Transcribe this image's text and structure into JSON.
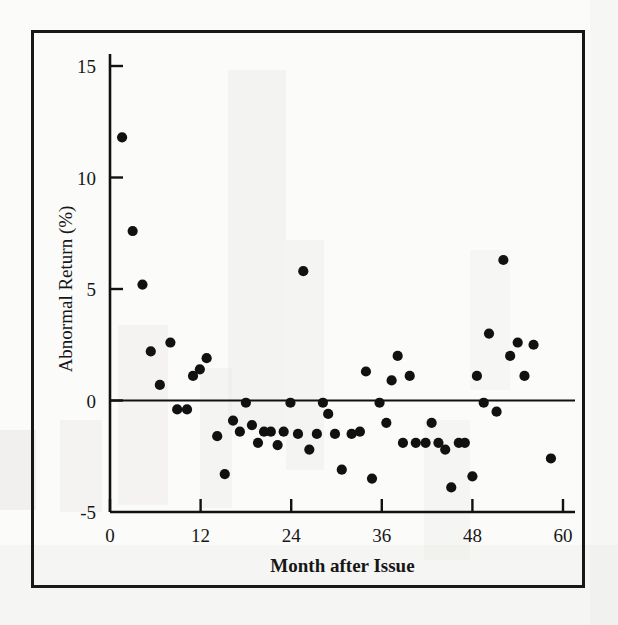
{
  "figure": {
    "background_color": "#fbfbfa",
    "frame_color": "#17181a",
    "marker_color": "#111111",
    "axis_color": "#111111"
  },
  "chart_data": {
    "type": "scatter",
    "title": "",
    "subtitle": "",
    "xlabel": "Month after Issue",
    "ylabel": "Abnormal Return (%)",
    "xlim": [
      0,
      60
    ],
    "ylim": [
      -5,
      15
    ],
    "xticks": [
      0,
      12,
      24,
      36,
      48,
      60
    ],
    "xtick_labels": [
      "0",
      "12",
      "24",
      "36",
      "48",
      "60"
    ],
    "yticks": [
      -5,
      0,
      5,
      10,
      15
    ],
    "ytick_labels": [
      "-5",
      "0",
      "5",
      "10",
      "15"
    ],
    "grid": false,
    "legend": null,
    "annotations": [],
    "zero_reference_line": 0,
    "series": [
      {
        "name": "Abnormal Return",
        "marker": "filled-circle",
        "color": "#111111",
        "points": [
          {
            "x": 1.6,
            "y": 11.8
          },
          {
            "x": 3.0,
            "y": 7.6
          },
          {
            "x": 4.3,
            "y": 5.2
          },
          {
            "x": 5.4,
            "y": 2.2
          },
          {
            "x": 6.6,
            "y": 0.7
          },
          {
            "x": 8.0,
            "y": 2.6
          },
          {
            "x": 8.9,
            "y": -0.4
          },
          {
            "x": 10.2,
            "y": -0.4
          },
          {
            "x": 11.0,
            "y": 1.1
          },
          {
            "x": 11.9,
            "y": 1.4
          },
          {
            "x": 12.8,
            "y": 1.9
          },
          {
            "x": 14.2,
            "y": -1.6
          },
          {
            "x": 15.2,
            "y": -3.3
          },
          {
            "x": 16.3,
            "y": -0.9
          },
          {
            "x": 17.2,
            "y": -1.4
          },
          {
            "x": 18.0,
            "y": -0.1
          },
          {
            "x": 18.8,
            "y": -1.1
          },
          {
            "x": 19.6,
            "y": -1.9
          },
          {
            "x": 20.4,
            "y": -1.4
          },
          {
            "x": 21.3,
            "y": -1.4
          },
          {
            "x": 22.2,
            "y": -2.0
          },
          {
            "x": 23.0,
            "y": -1.4
          },
          {
            "x": 23.9,
            "y": -0.1
          },
          {
            "x": 24.9,
            "y": -1.5
          },
          {
            "x": 25.6,
            "y": 5.8
          },
          {
            "x": 26.4,
            "y": -2.2
          },
          {
            "x": 27.4,
            "y": -1.5
          },
          {
            "x": 28.2,
            "y": -0.1
          },
          {
            "x": 28.9,
            "y": -0.6
          },
          {
            "x": 29.8,
            "y": -1.5
          },
          {
            "x": 30.7,
            "y": -3.1
          },
          {
            "x": 32.0,
            "y": -1.5
          },
          {
            "x": 33.1,
            "y": -1.4
          },
          {
            "x": 33.9,
            "y": 1.3
          },
          {
            "x": 34.7,
            "y": -3.5
          },
          {
            "x": 35.7,
            "y": -0.1
          },
          {
            "x": 36.6,
            "y": -1.0
          },
          {
            "x": 37.3,
            "y": 0.9
          },
          {
            "x": 38.1,
            "y": 2.0
          },
          {
            "x": 38.8,
            "y": -1.9
          },
          {
            "x": 39.7,
            "y": 1.1
          },
          {
            "x": 40.5,
            "y": -1.9
          },
          {
            "x": 41.8,
            "y": -1.9
          },
          {
            "x": 42.6,
            "y": -1.0
          },
          {
            "x": 43.5,
            "y": -1.9
          },
          {
            "x": 44.4,
            "y": -2.2
          },
          {
            "x": 45.2,
            "y": -3.9
          },
          {
            "x": 46.2,
            "y": -1.9
          },
          {
            "x": 47.0,
            "y": -1.9
          },
          {
            "x": 48.0,
            "y": -3.4
          },
          {
            "x": 48.6,
            "y": 1.1
          },
          {
            "x": 49.5,
            "y": -0.1
          },
          {
            "x": 50.2,
            "y": 3.0
          },
          {
            "x": 51.2,
            "y": -0.5
          },
          {
            "x": 52.1,
            "y": 6.3
          },
          {
            "x": 53.0,
            "y": 2.0
          },
          {
            "x": 54.0,
            "y": 2.6
          },
          {
            "x": 54.9,
            "y": 1.1
          },
          {
            "x": 56.1,
            "y": 2.5
          },
          {
            "x": 58.4,
            "y": -2.6
          }
        ]
      }
    ]
  }
}
